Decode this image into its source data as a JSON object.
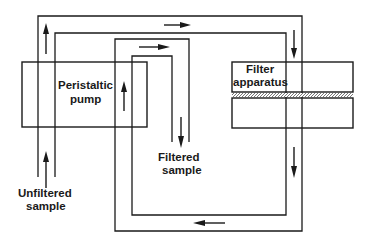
{
  "diagram": {
    "title": "",
    "components": {
      "pump": {
        "label_line1": "Peristaltic",
        "label_line2": "pump"
      },
      "filter": {
        "label_line1": "Filter",
        "label_line2": "apparatus"
      }
    },
    "labels": {
      "inlet_line1": "Unfiltered",
      "inlet_line2": "sample",
      "outlet_line1": "Filtered",
      "outlet_line2": "sample"
    },
    "flow_arrows": [
      {
        "id": "inlet-up",
        "direction": "up"
      },
      {
        "id": "outer-left-up",
        "direction": "up"
      },
      {
        "id": "top-right",
        "direction": "right"
      },
      {
        "id": "inner-top-right",
        "direction": "right"
      },
      {
        "id": "pump-up",
        "direction": "up"
      },
      {
        "id": "right-down-upper",
        "direction": "down"
      },
      {
        "id": "right-down-lower",
        "direction": "down"
      },
      {
        "id": "filtered-down",
        "direction": "down"
      },
      {
        "id": "bottom-left",
        "direction": "left"
      }
    ],
    "colors": {
      "line": "#1a1a1a",
      "background": "#ffffff"
    }
  }
}
